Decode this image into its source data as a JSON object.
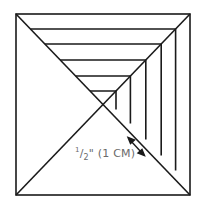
{
  "diagram": {
    "label": {
      "num": "1",
      "den": "2",
      "unit_inch": "\"",
      "metric": " (1 CM)"
    },
    "colors": {
      "line": "#1a1a1a",
      "label": "#6b6b6b",
      "background": "#ffffff"
    },
    "outer_square": {
      "x1": 16,
      "y1": 14,
      "x2": 190,
      "y2": 195
    },
    "strips": [
      {
        "y": 29,
        "x": 174
      },
      {
        "y": 44,
        "x": 161
      },
      {
        "y": 60,
        "x": 145
      },
      {
        "y": 76,
        "x": 129
      },
      {
        "y": 91,
        "x": 116
      }
    ]
  }
}
